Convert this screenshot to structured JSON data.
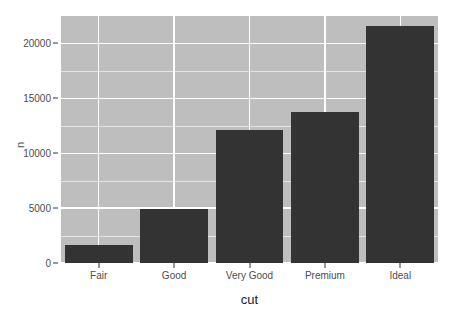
{
  "chart_data": {
    "type": "bar",
    "title": "",
    "subtitle": "",
    "xlabel": "cut",
    "ylabel": "n",
    "categories": [
      "Fair",
      "Good",
      "Very Good",
      "Premium",
      "Ideal"
    ],
    "values": [
      1610,
      4906,
      12082,
      13791,
      21551
    ],
    "series": [
      {
        "name": "n",
        "values": [
          1610,
          4906,
          12082,
          13791,
          21551
        ]
      }
    ],
    "ylim": [
      0,
      22500
    ],
    "yticks": [
      0,
      5000,
      10000,
      15000,
      20000
    ],
    "ytick_labels": [
      "0",
      "5000",
      "10000",
      "15000",
      "20000"
    ],
    "yticks_minor": [
      2500,
      7500,
      12500,
      17500
    ],
    "grid": true,
    "grid_color": "#ffffff",
    "legend": "none",
    "legend_position": "none",
    "panel_background": "#bebebe",
    "bar_color": "#333333",
    "axis_text_color": "#4d4d4d",
    "axis_title_color": "#1a1a1a",
    "bar_width_ratio": 0.9
  },
  "axes": {
    "y": {
      "title": "n",
      "tick_labels": [
        "0",
        "5000",
        "10000",
        "15000",
        "20000"
      ]
    },
    "x": {
      "title": "cut",
      "tick_labels": [
        "Fair",
        "Good",
        "Very Good",
        "Premium",
        "Ideal"
      ]
    }
  }
}
